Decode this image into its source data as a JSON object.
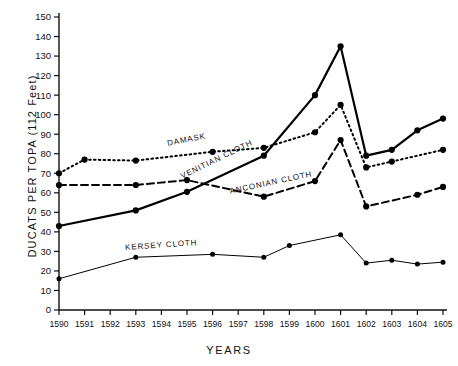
{
  "chart_data": {
    "type": "line",
    "title": "",
    "xlabel": "YEARS",
    "ylabel": "DUCATS  PER  TOPA (112 Feet)",
    "categories": [
      "1590",
      "1591",
      "1592",
      "1593",
      "1594",
      "1595",
      "1596",
      "1597",
      "1598",
      "1599",
      "1600",
      "1601",
      "1602",
      "1603",
      "1604",
      "1605"
    ],
    "xlim": [
      1590,
      1605
    ],
    "ylim": [
      0,
      150
    ],
    "ytick_labels": [
      "0",
      "10",
      "20",
      "30",
      "40",
      "50",
      "60",
      "70",
      "80",
      "90",
      "100",
      "110",
      "120",
      "130",
      "140",
      "150"
    ],
    "ytick_values": [
      0,
      10,
      20,
      30,
      40,
      50,
      60,
      70,
      80,
      90,
      100,
      110,
      120,
      130,
      140,
      150
    ],
    "grid": false,
    "legend_position": "inline-annotations",
    "series": [
      {
        "name": "DAMASK",
        "style": "dotted",
        "color": "#000000",
        "label_x": 1595.0,
        "label_y": 86,
        "label_rotate": -11,
        "x": [
          1590,
          1591,
          1593,
          1596,
          1598,
          1600,
          1601,
          1602,
          1603,
          1605
        ],
        "values": [
          70,
          77,
          76.5,
          81,
          83,
          91,
          105,
          73,
          76,
          82
        ]
      },
      {
        "name": "VENITIAN CLOTH",
        "style": "solid-thick",
        "color": "#000000",
        "label_x": 1596.2,
        "label_y": 76,
        "label_rotate": -26,
        "x": [
          1590,
          1593,
          1595,
          1598,
          1600,
          1601,
          1602,
          1603,
          1604,
          1605
        ],
        "values": [
          43,
          51,
          60.5,
          79,
          110,
          135,
          79,
          82,
          92,
          98
        ]
      },
      {
        "name": "ANCONIAN CLOTH",
        "style": "dashed",
        "color": "#000000",
        "label_x": 1598.3,
        "label_y": 64,
        "label_rotate": -12,
        "x": [
          1590,
          1593,
          1595,
          1598,
          1600,
          1601,
          1602,
          1604,
          1605
        ],
        "values": [
          64,
          64,
          66.5,
          58,
          66,
          87,
          53,
          59,
          63
        ]
      },
      {
        "name": "KERSEY CLOTH",
        "style": "solid-thin",
        "color": "#000000",
        "label_x": 1594.0,
        "label_y": 32,
        "label_rotate": -4,
        "x": [
          1590,
          1593,
          1596,
          1598,
          1599,
          1601,
          1602,
          1603,
          1604,
          1605
        ],
        "values": [
          16,
          27,
          28.5,
          27,
          33,
          38.5,
          24,
          25.5,
          23.5,
          24.5
        ]
      }
    ]
  },
  "axes": {
    "y_axis_caption": "DUCATS  PER  TOPA (112 Feet)",
    "x_axis_caption": "YEARS"
  }
}
